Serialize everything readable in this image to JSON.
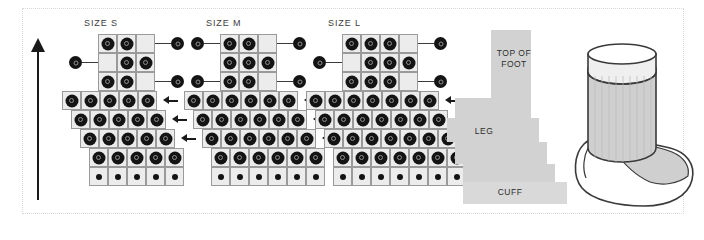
{
  "figure": {
    "kind": "knitting-stitch-chart",
    "background": "#ffffff",
    "frame_color": "#d8d8d8"
  },
  "direction_arrow": {
    "name": "work-direction-arrow",
    "orientation": "up",
    "color": "#1a1a1a"
  },
  "charts": [
    {
      "id": "size-s",
      "title": "SIZE S",
      "left": 62,
      "rows": [
        {
          "index": 1,
          "x": 36,
          "cells": 3,
          "dots": [
            1,
            1,
            0
          ],
          "dot_size": "big",
          "marker_right": true,
          "marker_left": false,
          "arrow": false
        },
        {
          "index": 2,
          "x": 36,
          "cells": 3,
          "dots": [
            0,
            1,
            1
          ],
          "dot_size": "big",
          "marker_right": false,
          "marker_left": true,
          "arrow": false
        },
        {
          "index": 3,
          "x": 36,
          "cells": 3,
          "dots": [
            1,
            1,
            0
          ],
          "dot_size": "big",
          "marker_right": true,
          "marker_left": false,
          "arrow": false
        },
        {
          "index": 4,
          "x": 0,
          "cells": 5,
          "dots": [
            1,
            1,
            1,
            1,
            1
          ],
          "dot_size": "big",
          "marker_right": false,
          "marker_left": false,
          "arrow": true
        },
        {
          "index": 5,
          "x": 9,
          "cells": 5,
          "dots": [
            1,
            1,
            1,
            1,
            1
          ],
          "dot_size": "big",
          "marker_right": false,
          "marker_left": false,
          "arrow": true
        },
        {
          "index": 6,
          "x": 18,
          "cells": 5,
          "dots": [
            1,
            1,
            1,
            1,
            1
          ],
          "dot_size": "big",
          "marker_right": false,
          "marker_left": false,
          "arrow": true
        },
        {
          "index": 7,
          "x": 27,
          "cells": 5,
          "dots": [
            1,
            1,
            1,
            1,
            1
          ],
          "dot_size": "big",
          "marker_right": false,
          "marker_left": false,
          "arrow": false
        },
        {
          "index": 8,
          "x": 27,
          "cells": 5,
          "dots": [
            1,
            1,
            1,
            1,
            1
          ],
          "dot_size": "small",
          "marker_right": false,
          "marker_left": false,
          "arrow": false
        }
      ]
    },
    {
      "id": "size-m",
      "title": "SIZE M",
      "left": 184,
      "rows": [
        {
          "index": 1,
          "x": 36,
          "cells": 3,
          "dots": [
            1,
            1,
            0
          ],
          "dot_size": "big",
          "marker_right": true,
          "marker_left": true,
          "arrow": false
        },
        {
          "index": 2,
          "x": 36,
          "cells": 3,
          "dots": [
            1,
            1,
            1
          ],
          "dot_size": "big",
          "marker_right": false,
          "marker_left": false,
          "arrow": false
        },
        {
          "index": 3,
          "x": 36,
          "cells": 3,
          "dots": [
            1,
            1,
            0
          ],
          "dot_size": "big",
          "marker_right": true,
          "marker_left": true,
          "arrow": false
        },
        {
          "index": 4,
          "x": 0,
          "cells": 6,
          "dots": [
            1,
            1,
            1,
            1,
            1,
            1
          ],
          "dot_size": "big",
          "marker_right": false,
          "marker_left": false,
          "arrow": true
        },
        {
          "index": 5,
          "x": 9,
          "cells": 6,
          "dots": [
            1,
            1,
            1,
            1,
            1,
            1
          ],
          "dot_size": "big",
          "marker_right": false,
          "marker_left": false,
          "arrow": true
        },
        {
          "index": 6,
          "x": 18,
          "cells": 6,
          "dots": [
            1,
            1,
            1,
            1,
            1,
            1
          ],
          "dot_size": "big",
          "marker_right": false,
          "marker_left": false,
          "arrow": true
        },
        {
          "index": 7,
          "x": 27,
          "cells": 6,
          "dots": [
            1,
            1,
            1,
            1,
            1,
            1
          ],
          "dot_size": "big",
          "marker_right": false,
          "marker_left": false,
          "arrow": false
        },
        {
          "index": 8,
          "x": 27,
          "cells": 6,
          "dots": [
            1,
            1,
            1,
            1,
            1,
            1
          ],
          "dot_size": "small",
          "marker_right": false,
          "marker_left": false,
          "arrow": false
        }
      ]
    },
    {
      "id": "size-l",
      "title": "SIZE L",
      "left": 306,
      "rows": [
        {
          "index": 1,
          "x": 36,
          "cells": 4,
          "dots": [
            1,
            1,
            1,
            0
          ],
          "dot_size": "big",
          "marker_right": true,
          "marker_left": false,
          "arrow": false
        },
        {
          "index": 2,
          "x": 36,
          "cells": 4,
          "dots": [
            0,
            1,
            1,
            1
          ],
          "dot_size": "big",
          "marker_right": false,
          "marker_left": true,
          "arrow": false
        },
        {
          "index": 3,
          "x": 36,
          "cells": 4,
          "dots": [
            1,
            1,
            1,
            0
          ],
          "dot_size": "big",
          "marker_right": true,
          "marker_left": false,
          "arrow": false
        },
        {
          "index": 4,
          "x": 0,
          "cells": 7,
          "dots": [
            1,
            1,
            1,
            1,
            1,
            1,
            1
          ],
          "dot_size": "big",
          "marker_right": false,
          "marker_left": false,
          "arrow": true
        },
        {
          "index": 5,
          "x": 9,
          "cells": 7,
          "dots": [
            1,
            1,
            1,
            1,
            1,
            1,
            1
          ],
          "dot_size": "big",
          "marker_right": false,
          "marker_left": false,
          "arrow": true
        },
        {
          "index": 6,
          "x": 18,
          "cells": 7,
          "dots": [
            1,
            1,
            1,
            1,
            1,
            1,
            1
          ],
          "dot_size": "big",
          "marker_right": false,
          "marker_left": false,
          "arrow": true
        },
        {
          "index": 7,
          "x": 27,
          "cells": 7,
          "dots": [
            1,
            1,
            1,
            1,
            1,
            1,
            1
          ],
          "dot_size": "big",
          "marker_right": false,
          "marker_left": false,
          "arrow": false
        },
        {
          "index": 8,
          "x": 27,
          "cells": 7,
          "dots": [
            1,
            1,
            1,
            1,
            1,
            1,
            1
          ],
          "dot_size": "small",
          "marker_right": false,
          "marker_left": false,
          "arrow": false
        }
      ]
    }
  ],
  "schematic": {
    "name": "sock-flat-schematic",
    "fill": "#d2d2d2",
    "cuff_fill": "#d9d9d9",
    "labels": {
      "top_of_foot": "TOP OF\nFOOT",
      "leg": "LEG",
      "cuff": "CUFF"
    },
    "steps": [
      {
        "name": "top-of-foot-block",
        "x": 44,
        "y": 0,
        "w": 40,
        "h": 68
      },
      {
        "name": "leg-block-1",
        "x": 8,
        "y": 68,
        "w": 76,
        "h": 20
      },
      {
        "name": "leg-block-2",
        "x": 0,
        "y": 88,
        "w": 92,
        "h": 24
      },
      {
        "name": "leg-block-3",
        "x": 8,
        "y": 112,
        "w": 92,
        "h": 22
      },
      {
        "name": "leg-block-4",
        "x": 16,
        "y": 134,
        "w": 92,
        "h": 18
      },
      {
        "name": "cuff-block",
        "x": 16,
        "y": 152,
        "w": 104,
        "h": 22
      }
    ]
  },
  "sock": {
    "name": "sock-illustration",
    "outline_color": "#3a3a3a",
    "leg_fill": "#cfcfcf",
    "foot_fill": "#ffffff",
    "top_band_fill": "#efefef",
    "instep_fill": "#cfcfcf"
  }
}
